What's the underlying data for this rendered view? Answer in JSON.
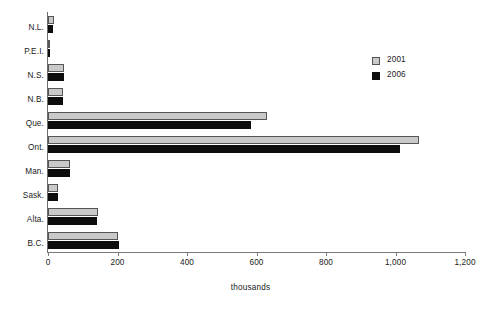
{
  "chart_data": {
    "type": "bar",
    "orientation": "horizontal",
    "title": "",
    "subtitle": "",
    "xlabel": "thousands",
    "ylabel": "",
    "xlim": [
      0,
      1200
    ],
    "xticks": [
      0,
      200,
      400,
      600,
      800,
      1000,
      1200
    ],
    "xticklabels": [
      "0",
      "200",
      "400",
      "600",
      "800",
      "1,000",
      "1,200"
    ],
    "grid": false,
    "legend_position": "upper right",
    "categories": [
      "N.L.",
      "P.E.I.",
      "N.S.",
      "N.B.",
      "Que.",
      "Ont.",
      "Man.",
      "Sask.",
      "Alta.",
      "B.C."
    ],
    "series": [
      {
        "name": "2001",
        "color": "#c9c9c9",
        "edge_color": "#555555",
        "values": [
          16,
          4,
          45,
          44,
          630,
          1069,
          63,
          28,
          145,
          200
        ]
      },
      {
        "name": "2006",
        "color": "#0d0d0d",
        "edge_color": "#0d0d0d",
        "values": [
          14,
          4,
          46,
          43,
          585,
          1014,
          64,
          29,
          142,
          203
        ]
      }
    ]
  },
  "axes": {
    "x_axis_title": "thousands",
    "x_tick_labels": [
      "0",
      "200",
      "400",
      "600",
      "800",
      "1,000",
      "1,200"
    ],
    "y_tick_labels": [
      "N.L.",
      "P.E.I.",
      "N.S.",
      "N.B.",
      "Que.",
      "Ont.",
      "Man.",
      "Sask.",
      "Alta.",
      "B.C."
    ]
  },
  "legend": {
    "items": [
      {
        "label": "2001",
        "swatch": "legend-swatch-2001"
      },
      {
        "label": "2006",
        "swatch": "legend-swatch-2006"
      }
    ]
  }
}
